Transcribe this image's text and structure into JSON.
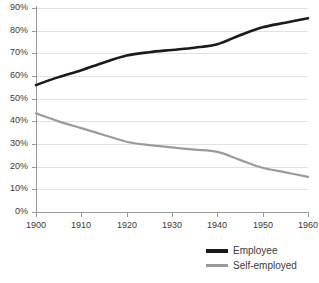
{
  "chart_data": {
    "type": "line",
    "title": "",
    "subtitle": "",
    "xlabel": "",
    "ylabel": "",
    "xlim": [
      1900,
      1960
    ],
    "ylim": [
      0,
      90
    ],
    "grid": true,
    "legend_position": "bottom-right",
    "x_ticks": [
      "1900",
      "1910",
      "1920",
      "1930",
      "1940",
      "1950",
      "1960"
    ],
    "x_tick_values": [
      1900,
      1910,
      1920,
      1930,
      1940,
      1950,
      1960
    ],
    "y_ticks": [
      "0%",
      "10%",
      "20%",
      "30%",
      "40%",
      "50%",
      "60%",
      "70%",
      "80%",
      "90%"
    ],
    "y_tick_values": [
      0,
      10,
      20,
      30,
      40,
      50,
      60,
      70,
      80,
      90
    ],
    "x": [
      1900,
      1905,
      1910,
      1915,
      1920,
      1925,
      1930,
      1935,
      1940,
      1945,
      1950,
      1955,
      1960
    ],
    "series": [
      {
        "name": "Employee",
        "color": "#1a1a1a",
        "width": 2.6,
        "values": [
          56.0,
          59.5,
          62.5,
          66.0,
          69.0,
          70.5,
          71.5,
          72.5,
          74.0,
          78.0,
          81.5,
          83.5,
          85.5
        ]
      },
      {
        "name": "Self-employed",
        "color": "#9b9b9b",
        "width": 2.2,
        "values": [
          43.5,
          40.0,
          37.0,
          34.0,
          31.0,
          29.5,
          28.5,
          27.5,
          26.5,
          23.0,
          19.5,
          17.5,
          15.5
        ]
      }
    ]
  },
  "legend": {
    "items": [
      {
        "label": "Employee"
      },
      {
        "label": "Self-employed"
      }
    ]
  },
  "colors": {
    "employee": "#1a1a1a",
    "self_employed": "#9b9b9b",
    "grid": "#e2e2e2",
    "axis": "#9a9a9a",
    "text": "#3a3a3a",
    "background": "#ffffff"
  }
}
